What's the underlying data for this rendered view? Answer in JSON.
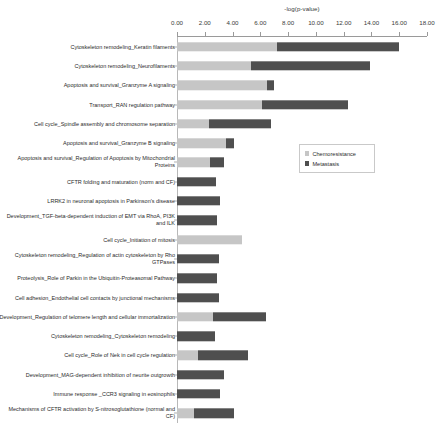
{
  "chart_data": {
    "type": "bar",
    "orientation": "horizontal",
    "stacked": true,
    "title": "",
    "xlabel": "-log(p-value)",
    "ylabel": "",
    "xlim": [
      0.0,
      18.0
    ],
    "xticks": [
      "0.00",
      "2.00",
      "4.00",
      "6.00",
      "8.00",
      "10.00",
      "12.00",
      "14.00",
      "16.00",
      "18.00"
    ],
    "xtick_values": [
      0,
      2,
      4,
      6,
      8,
      10,
      12,
      14,
      16,
      18
    ],
    "grid": false,
    "legend_position": "center-right",
    "legend": [
      "Chemoresistance",
      "Metastasis"
    ],
    "colors": {
      "chemoresistance": "#c6c6c6",
      "metastasis": "#4f4f4f",
      "axis": "#9a9a9a",
      "text": "#2b2b2b"
    },
    "categories": [
      "Cytoskeleton remodeling_Keratin filaments",
      "Cytoskeleton remodeling_Neurofilaments",
      "Apoptosis and survival_Granzyme A signaling",
      "Transport_RAN regulation pathway",
      "Cell cycle_Spindle assembly and chromosome separation",
      "Apoptosis and survival_Granzyme B signaling",
      "Apoptosis and survival_Regulation of Apoptosis by Mitochondrial Proteins",
      "CFTR folding and maturation (norm and CF)",
      "LRRK2 in neuronal apoptosis in Parkinson's disease",
      "Development_TGF-beta-dependent induction of EMT via RhoA, PI3K and ILK",
      "Cell cycle_Initiation of mitosis",
      "Cytoskeleton remodeling_Regulation of actin cytoskeleton by Rho GTPases",
      "Proteolysis_Role of Parkin in the Ubiquitin-Proteasomal Pathway",
      "Cell adhesion_Endothelial cell contacts by junctional mechanisms",
      "Development_Regulation of telomere length and cellular immortalization",
      "Cytoskeleton remodeling_Cytoskeleton remodeling",
      "Cell cycle_Role of Nek in cell cycle regulation",
      "Development_MAG-dependent inhibition of neurite outgrowth",
      "Immune response _CCR3 signaling in eosinophils",
      "Mechanisms of CFTR activation by S-nitrosoglutathione (normal and CF)"
    ],
    "series": [
      {
        "name": "Chemoresistance",
        "values": [
          7.2,
          5.3,
          6.5,
          6.1,
          2.3,
          3.5,
          2.4,
          0.0,
          0.0,
          0.0,
          4.7,
          0.0,
          0.0,
          0.0,
          2.6,
          0.0,
          1.5,
          0.0,
          0.0,
          1.2
        ]
      },
      {
        "name": "Metastasis",
        "values": [
          8.8,
          8.6,
          0.5,
          6.2,
          4.5,
          0.6,
          1.0,
          2.8,
          3.1,
          2.9,
          0.0,
          3.0,
          2.9,
          3.0,
          3.8,
          2.7,
          3.6,
          3.4,
          3.1,
          2.9
        ]
      }
    ]
  }
}
